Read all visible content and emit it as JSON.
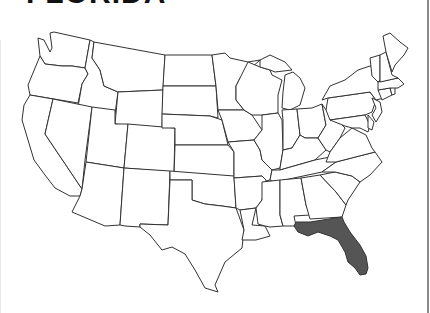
{
  "title": "FLORIDA",
  "map": {
    "description": "Outline map of the contiguous United States",
    "highlighted_state": "Florida",
    "highlight_color": "#555555",
    "state_fill": "#ffffff",
    "border_color": "#333333"
  }
}
